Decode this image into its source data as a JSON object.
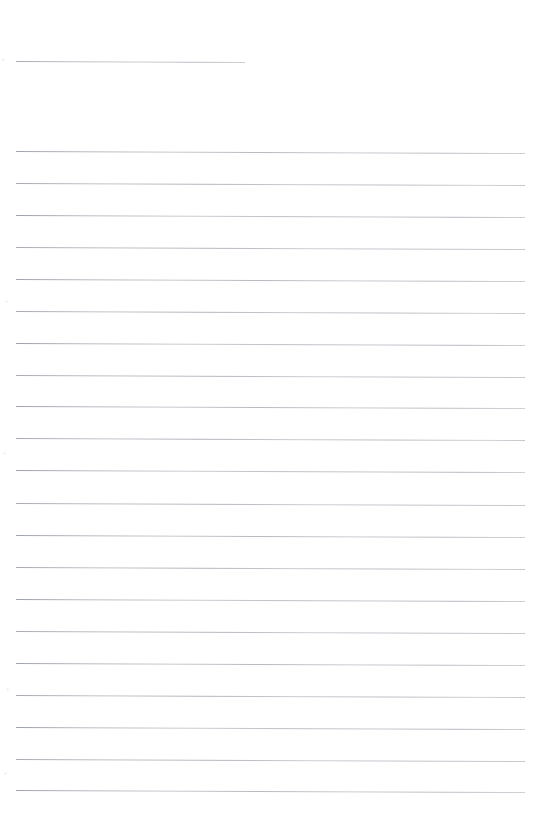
{
  "document": {
    "type": "scanned-ruled-notepaper",
    "title": "",
    "page_width": 541,
    "page_height": 826,
    "background_color": "#ffffff",
    "rule_color": "#b9bcc2",
    "body_text": "",
    "visible_text": "",
    "header_rule": {
      "name": "header-rule",
      "x": 16,
      "y": 61,
      "width": 229,
      "tilt_deg": 0.25
    },
    "body_rules": {
      "count": 21,
      "x": 16,
      "width": 509,
      "spacing": 32,
      "first_y": 151,
      "tilt_deg": 0.22,
      "y_positions": [
        151,
        183,
        215,
        247,
        279,
        311,
        343,
        375,
        406,
        438,
        470,
        503,
        535,
        567,
        599,
        631,
        663,
        695,
        727,
        759,
        790
      ]
    },
    "speckles": [
      {
        "x": 2,
        "y": 58
      },
      {
        "x": 5,
        "y": 300
      },
      {
        "x": 3,
        "y": 452
      },
      {
        "x": 6,
        "y": 688
      },
      {
        "x": 4,
        "y": 772
      }
    ]
  }
}
